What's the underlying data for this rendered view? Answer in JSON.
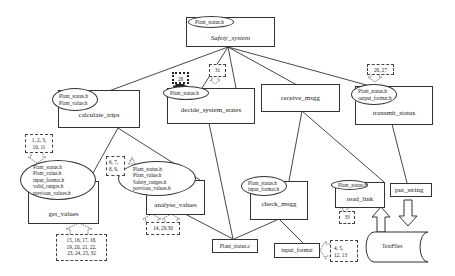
{
  "diagram": {
    "root": {
      "label": "Safety_system",
      "includes": [
        "Plant_status.h"
      ]
    },
    "modules": [
      {
        "id": "calculate_trips",
        "label": "calculate_trips",
        "includes": [
          "Plant_status.h",
          "Plant_value.h"
        ]
      },
      {
        "id": "decide_system_states",
        "label": "decide_system_states",
        "includes": [
          "Plant_status.h"
        ]
      },
      {
        "id": "receive_msgg",
        "label": "receive_msgg",
        "includes": []
      },
      {
        "id": "transmit_status",
        "label": "transmit_status",
        "includes": [
          "Plant_status.h",
          "output_format.h"
        ]
      },
      {
        "id": "get_values",
        "label": "get_values",
        "includes": [
          "Plant_status.h",
          "Plant_value.h",
          "input_format.h",
          "valid_ranges.h",
          "previous_values.h"
        ]
      },
      {
        "id": "analyse_values",
        "label": "analyse_values",
        "includes": [
          "Plant_status.h",
          "Plant_value.h",
          "Safety_ranges.h",
          "previous_values.h"
        ]
      },
      {
        "id": "check_msgg",
        "label": "check_msgg",
        "includes": [
          "Plant_status.h",
          "input_format.h"
        ]
      },
      {
        "id": "read_link",
        "label": "read_link",
        "includes": [
          "Plant_status.h"
        ]
      },
      {
        "id": "put_string",
        "label": "put_string",
        "includes": []
      },
      {
        "id": "plant_status_c",
        "label": "Plant_status.c",
        "includes": []
      },
      {
        "id": "input_format",
        "label": "input_format",
        "includes": []
      }
    ],
    "datastore": {
      "label": "TextFiles"
    },
    "annotations": {
      "decide_28": "28",
      "decide_31": "31",
      "transmit_26_27": "26, 27",
      "get_1_11_line1": "1, 2, 3,",
      "get_1_11_line2": "10, 11",
      "get_15_32_line1": "15, 16, 17, 18,",
      "get_15_32_line2": "19, 20, 21, 22,",
      "get_15_32_line3": "23, 24, 25, 32",
      "analyse_6_9_line1": "6, 7,",
      "analyse_6_9_line2": "8, 9,",
      "analyse_14_30": "14, 29,30",
      "read_33": "33",
      "input_4_13_line1": "4, 5,",
      "input_4_13_line2": "12, 13"
    },
    "colors": {
      "line": "#333333",
      "background": "#ffffff"
    }
  }
}
